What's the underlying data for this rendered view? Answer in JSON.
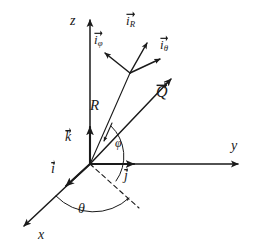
{
  "figure": {
    "background_color": "#ffffff",
    "stroke_color": "#1a1a1a",
    "width": 258,
    "height": 251
  },
  "axes": [
    {
      "id": "z",
      "label": "z",
      "direction": "up",
      "x1": 90,
      "y1": 164,
      "x2": 90,
      "y2": 18
    },
    {
      "id": "y",
      "label": "y",
      "direction": "right",
      "x1": 90,
      "y1": 164,
      "x2": 240,
      "y2": 164
    },
    {
      "id": "x",
      "label": "x",
      "direction": "down-left",
      "x1": 90,
      "y1": 164,
      "x2": 22,
      "y2": 228
    }
  ],
  "origin": {
    "x": 90,
    "y": 164
  },
  "basis_vectors": [
    {
      "id": "k",
      "letter": "k",
      "subscript": "",
      "tip_x": 90,
      "tip_y": 125,
      "label_x": 68,
      "label_y": 131
    },
    {
      "id": "i",
      "letter": "i",
      "subscript": "",
      "tip_x": 64,
      "tip_y": 188,
      "label_x": 52,
      "label_y": 164
    },
    {
      "id": "j",
      "letter": "j",
      "subscript": "",
      "tip_x": 136,
      "tip_y": 164,
      "label_x": 125,
      "label_y": 170
    }
  ],
  "spherical_unit_vectors": [
    {
      "id": "i_R",
      "letter": "i",
      "subscript": "R",
      "tip_x": 149,
      "tip_y": 41,
      "label_x": 126,
      "label_y": 14
    },
    {
      "id": "i_phi",
      "letter": "i",
      "subscript": "φ",
      "tip_x": 103,
      "tip_y": 52,
      "label_x": 95,
      "label_y": 32
    },
    {
      "id": "i_theta",
      "letter": "i",
      "subscript": "θ",
      "tip_x": 162,
      "tip_y": 58,
      "label_x": 160,
      "label_y": 38
    }
  ],
  "position_vector": {
    "id": "Q",
    "letter": "Q",
    "label": "Q",
    "tip_x": 173,
    "tip_y": 77,
    "label_x": 157,
    "label_y": 86
  },
  "radial_line": {
    "id": "R",
    "label": "R",
    "label_x": 92,
    "label_y": 100,
    "junction_x": 130,
    "junction_y": 73,
    "note": "line from origin to unit-vector triad junction, reverse arrowhead toward origin"
  },
  "angles": [
    {
      "id": "phi",
      "label": "φ",
      "label_x": 115,
      "label_y": 141,
      "description": "azimuthal-to-polar angle arc between R line and projection"
    },
    {
      "id": "theta",
      "label": "θ",
      "label_x": 78,
      "label_y": 205,
      "description": "angle arc from x-axis to projection line"
    }
  ],
  "projection_line": {
    "id": "dashed-projection",
    "style": "dashed",
    "x1": 90,
    "y1": 164,
    "x2": 138,
    "y2": 207
  }
}
